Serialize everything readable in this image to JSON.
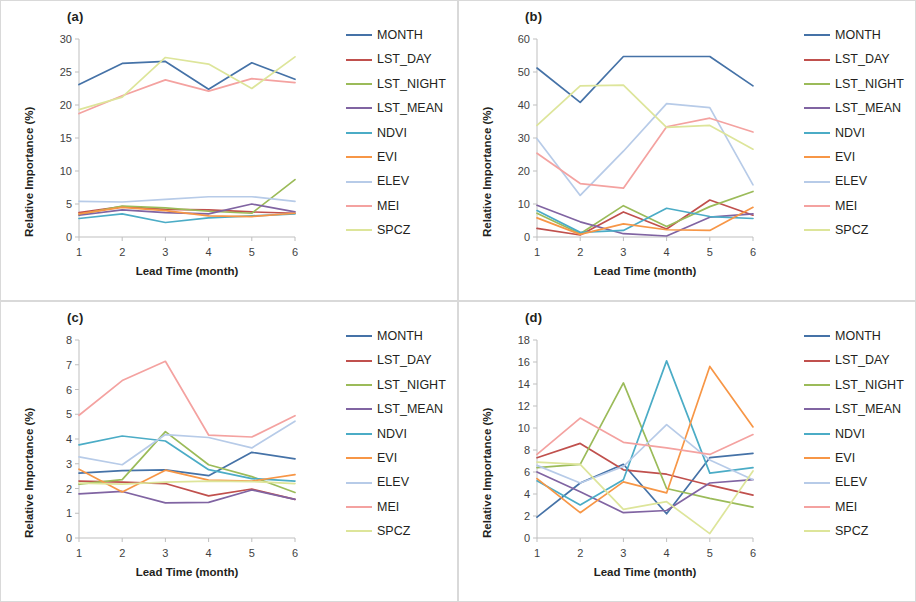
{
  "figure": {
    "x_axis_title": "Lead Time (month)",
    "y_axis_title": "Relative Importance (%)",
    "x_ticks": [
      "1",
      "2",
      "3",
      "4",
      "5",
      "6"
    ]
  },
  "series_meta": [
    {
      "name": "MONTH",
      "color": "#4572a7"
    },
    {
      "name": "LST_DAY",
      "color": "#c0504d"
    },
    {
      "name": "LST_NIGHT",
      "color": "#9bbb59"
    },
    {
      "name": "LST_MEAN",
      "color": "#8064a2"
    },
    {
      "name": "NDVI",
      "color": "#4bacc6"
    },
    {
      "name": "EVI",
      "color": "#f79646"
    },
    {
      "name": "ELEV",
      "color": "#b7cbe8"
    },
    {
      "name": "MEI",
      "color": "#f4a2a0"
    },
    {
      "name": "SPCZ",
      "color": "#dde59a"
    }
  ],
  "panels": [
    {
      "id": "a",
      "label": "(a)",
      "chart_data": {
        "type": "line",
        "title": "(a)",
        "xlabel": "Lead Time (month)",
        "ylabel": "Relative Importance (%)",
        "x": [
          1,
          2,
          3,
          4,
          5,
          6
        ],
        "xlim": [
          1,
          6
        ],
        "ylim": [
          0,
          30
        ],
        "yticks": [
          0,
          5,
          10,
          15,
          20,
          25,
          30
        ],
        "grid": false,
        "legend_position": "right",
        "series": [
          {
            "name": "MONTH",
            "values": [
              23.1,
              26.3,
              26.6,
              22.4,
              26.4,
              23.9
            ]
          },
          {
            "name": "LST_DAY",
            "values": [
              3.7,
              4.6,
              4.2,
              4.1,
              3.8,
              3.6
            ]
          },
          {
            "name": "LST_NIGHT",
            "values": [
              3.4,
              4.7,
              4.4,
              3.9,
              3.6,
              8.7
            ]
          },
          {
            "name": "LST_MEAN",
            "values": [
              3.3,
              4.1,
              3.7,
              3.5,
              5.0,
              3.8
            ]
          },
          {
            "name": "NDVI",
            "values": [
              2.8,
              3.5,
              2.2,
              2.9,
              3.2,
              3.5
            ]
          },
          {
            "name": "EVI",
            "values": [
              3.5,
              4.5,
              4.0,
              3.2,
              3.1,
              3.6
            ]
          },
          {
            "name": "ELEV",
            "values": [
              5.4,
              5.3,
              5.7,
              6.1,
              6.1,
              5.4
            ]
          },
          {
            "name": "MEI",
            "values": [
              18.7,
              21.4,
              23.8,
              22.1,
              24.0,
              23.4
            ]
          },
          {
            "name": "SPCZ",
            "values": [
              19.3,
              21.2,
              27.2,
              26.2,
              22.5,
              27.3
            ]
          }
        ]
      }
    },
    {
      "id": "b",
      "label": "(b)",
      "chart_data": {
        "type": "line",
        "title": "(b)",
        "xlabel": "Lead Time (month)",
        "ylabel": "Relative Importance (%)",
        "x": [
          1,
          2,
          3,
          4,
          5,
          6
        ],
        "xlim": [
          1,
          6
        ],
        "ylim": [
          0,
          60
        ],
        "yticks": [
          0,
          10,
          20,
          30,
          40,
          50,
          60
        ],
        "grid": false,
        "legend_position": "right",
        "series": [
          {
            "name": "MONTH",
            "values": [
              51.2,
              40.8,
              54.7,
              54.7,
              54.7,
              45.8
            ]
          },
          {
            "name": "LST_DAY",
            "values": [
              2.6,
              0.6,
              7.6,
              2.4,
              11.2,
              6.6
            ]
          },
          {
            "name": "LST_NIGHT",
            "values": [
              7.2,
              1.0,
              9.5,
              3.2,
              9.2,
              13.8
            ]
          },
          {
            "name": "LST_MEAN",
            "values": [
              9.6,
              4.6,
              1.0,
              0.3,
              6.0,
              7.0
            ]
          },
          {
            "name": "NDVI",
            "values": [
              8.0,
              1.4,
              2.0,
              8.7,
              6.2,
              5.6
            ]
          },
          {
            "name": "EVI",
            "values": [
              5.8,
              0.8,
              4.0,
              2.2,
              2.0,
              9.0
            ]
          },
          {
            "name": "ELEV",
            "values": [
              29.8,
              12.6,
              26.0,
              40.4,
              39.2,
              15.8
            ]
          },
          {
            "name": "MEI",
            "values": [
              25.4,
              16.2,
              14.8,
              33.4,
              36.0,
              31.8
            ]
          },
          {
            "name": "SPCZ",
            "values": [
              33.8,
              45.8,
              46.0,
              33.2,
              33.8,
              26.6
            ]
          }
        ]
      }
    },
    {
      "id": "c",
      "label": "(c)",
      "chart_data": {
        "type": "line",
        "title": "(c)",
        "xlabel": "Lead Time (month)",
        "ylabel": "Relative Importance (%)",
        "x": [
          1,
          2,
          3,
          4,
          5,
          6
        ],
        "xlim": [
          1,
          6
        ],
        "ylim": [
          0,
          8
        ],
        "yticks": [
          0,
          1,
          2,
          3,
          4,
          5,
          6,
          7,
          8
        ],
        "grid": false,
        "legend_position": "right",
        "series": [
          {
            "name": "MONTH",
            "values": [
              2.62,
              2.72,
              2.75,
              2.52,
              3.46,
              3.2
            ]
          },
          {
            "name": "LST_DAY",
            "values": [
              2.3,
              2.26,
              2.2,
              1.7,
              1.98,
              1.56
            ]
          },
          {
            "name": "LST_NIGHT",
            "values": [
              2.18,
              2.36,
              4.3,
              2.96,
              2.48,
              1.84
            ]
          },
          {
            "name": "LST_MEAN",
            "values": [
              1.78,
              1.88,
              1.42,
              1.44,
              1.94,
              1.56
            ]
          },
          {
            "name": "NDVI",
            "values": [
              3.76,
              4.12,
              3.92,
              2.76,
              2.4,
              2.3
            ]
          },
          {
            "name": "EVI",
            "values": [
              2.78,
              1.86,
              2.74,
              2.34,
              2.3,
              2.56
            ]
          },
          {
            "name": "ELEV",
            "values": [
              3.28,
              2.96,
              4.18,
              4.06,
              3.64,
              4.72
            ]
          },
          {
            "name": "MEI",
            "values": [
              4.96,
              6.36,
              7.14,
              4.16,
              4.08,
              4.94
            ]
          },
          {
            "name": "SPCZ",
            "values": [
              2.22,
              2.18,
              2.26,
              2.3,
              2.28,
              2.2
            ]
          }
        ]
      }
    },
    {
      "id": "d",
      "label": "(d)",
      "chart_data": {
        "type": "line",
        "title": "(d)",
        "xlabel": "Lead Time (month)",
        "ylabel": "Relative Importance (%)",
        "x": [
          1,
          2,
          3,
          4,
          5,
          6
        ],
        "xlim": [
          1,
          6
        ],
        "ylim": [
          0,
          18
        ],
        "yticks": [
          0,
          2,
          4,
          6,
          8,
          10,
          12,
          14,
          16,
          18
        ],
        "grid": false,
        "legend_position": "right",
        "series": [
          {
            "name": "MONTH",
            "values": [
              1.9,
              5.0,
              6.7,
              2.2,
              7.3,
              7.7
            ]
          },
          {
            "name": "LST_DAY",
            "values": [
              7.3,
              8.6,
              6.2,
              5.8,
              4.8,
              3.9
            ]
          },
          {
            "name": "LST_NIGHT",
            "values": [
              6.4,
              6.7,
              14.1,
              4.5,
              3.6,
              2.8
            ]
          },
          {
            "name": "LST_MEAN",
            "values": [
              6.0,
              4.2,
              2.3,
              2.5,
              5.0,
              5.3
            ]
          },
          {
            "name": "NDVI",
            "values": [
              5.2,
              3.0,
              5.3,
              16.1,
              5.9,
              6.4
            ]
          },
          {
            "name": "EVI",
            "values": [
              5.4,
              2.3,
              5.1,
              4.1,
              15.6,
              10.1
            ]
          },
          {
            "name": "ELEV",
            "values": [
              6.6,
              5.0,
              6.5,
              10.3,
              7.1,
              5.3
            ]
          },
          {
            "name": "MEI",
            "values": [
              7.6,
              10.9,
              8.7,
              8.2,
              7.6,
              9.4
            ]
          },
          {
            "name": "SPCZ",
            "values": [
              6.9,
              6.7,
              2.6,
              3.3,
              0.4,
              6.1
            ]
          }
        ]
      }
    }
  ]
}
